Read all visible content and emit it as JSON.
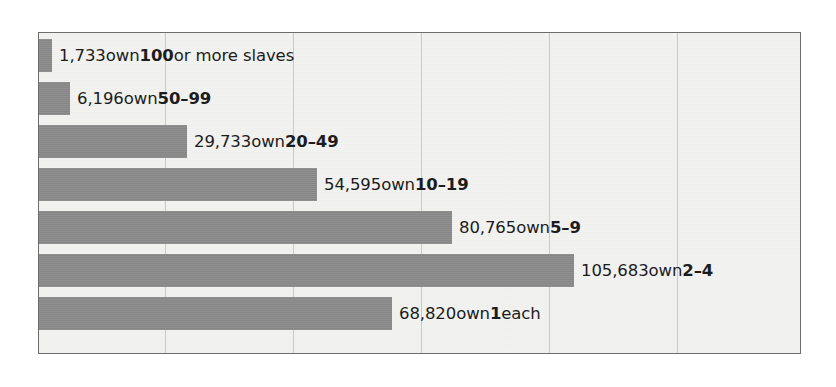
{
  "chart_data": {
    "type": "bar",
    "orientation": "horizontal",
    "title": "",
    "subtitle": "",
    "xlabel": "",
    "ylabel": "",
    "grid": true,
    "gridlines_x": [
      20000,
      40000,
      60000,
      80000,
      100000
    ],
    "xlim": [
      0,
      124000
    ],
    "legend": "none",
    "categories": [
      "100 or more slaves",
      "50-99",
      "20-49",
      "10-19",
      "5-9",
      "2-4",
      "1 each"
    ],
    "values": [
      1733,
      6196,
      29733,
      54595,
      80765,
      105683,
      68820
    ],
    "bar_color": "#8a8a8a",
    "background_color": "#f2f2f0",
    "frame_color": "#6d6d6d",
    "gridline_color": "#c9c9c7",
    "text_color": "#1c1c1c"
  },
  "bars": [
    {
      "value_text": "1,733",
      "mid_text": " own ",
      "category_text": "100",
      "tail_text": " or more slaves",
      "value": 1733
    },
    {
      "value_text": "6,196",
      "mid_text": " own ",
      "category_text": "50–99",
      "tail_text": "",
      "value": 6196
    },
    {
      "value_text": "29,733",
      "mid_text": " own ",
      "category_text": "20–49",
      "tail_text": "",
      "value": 29733
    },
    {
      "value_text": "54,595",
      "mid_text": " own ",
      "category_text": "10–19",
      "tail_text": "",
      "value": 54595
    },
    {
      "value_text": "80,765",
      "mid_text": " own ",
      "category_text": "5–9",
      "tail_text": "",
      "value": 80765
    },
    {
      "value_text": "105,683",
      "mid_text": " own ",
      "category_text": "2–4",
      "tail_text": "",
      "value": 105683
    },
    {
      "value_text": "68,820",
      "mid_text": " own ",
      "category_text": "1",
      "tail_text": " each",
      "value": 68820
    }
  ],
  "layout": {
    "bar_tops": [
      6,
      49,
      92,
      135,
      178,
      221,
      264
    ],
    "bar_height": 33,
    "bar_pixel_widths": [
      13,
      31,
      148,
      278,
      413,
      535,
      353
    ],
    "gridline_x": [
      126,
      254,
      382,
      510,
      638
    ],
    "label_gap": 7
  }
}
